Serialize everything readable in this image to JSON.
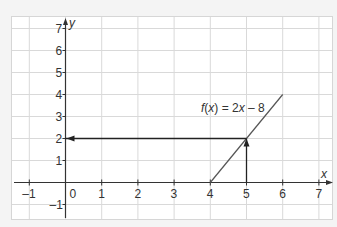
{
  "chart_data": {
    "type": "line",
    "title": "",
    "xlabel": "x",
    "ylabel": "y",
    "xlim": [
      -1.5,
      7.4
    ],
    "ylim": [
      -1.7,
      7.6
    ],
    "grid": true,
    "x_ticks": [
      "-1",
      "0",
      "1",
      "2",
      "3",
      "4",
      "5",
      "6",
      "7"
    ],
    "y_ticks": [
      "-1",
      "1",
      "2",
      "3",
      "4",
      "5",
      "6",
      "7"
    ],
    "series": [
      {
        "name": "f(x) = 2x - 8",
        "x": [
          4,
          6
        ],
        "y": [
          0,
          4
        ]
      }
    ],
    "annotations": [
      {
        "type": "arrow",
        "from": [
          5,
          0
        ],
        "to": [
          5,
          2
        ],
        "text": "vertical arrow from x=5 up to the line"
      },
      {
        "type": "arrow",
        "from": [
          5,
          2
        ],
        "to": [
          0,
          2
        ],
        "text": "horizontal arrow from the line to y-axis at y=2"
      },
      {
        "type": "label",
        "text": "f(x) = 2x – 8",
        "at": [
          4.3,
          4.6
        ]
      }
    ]
  },
  "labels": {
    "function": "f(x) = 2x – 8",
    "x_axis": "x",
    "y_axis": "y",
    "origin": "0"
  },
  "colors": {
    "background": "#f4f4f4",
    "plot_bg": "#ffffff",
    "grid": "#d6d6d6",
    "axis": "#333333",
    "line": "#555555"
  }
}
